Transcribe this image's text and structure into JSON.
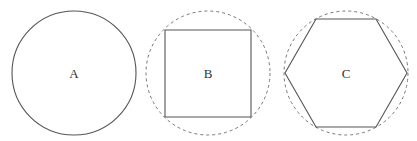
{
  "figures": [
    {
      "id": "A",
      "label": "A",
      "shape": "circle",
      "outline": "solid",
      "circle": {
        "cx": 74,
        "cy": 73,
        "r": 62
      }
    },
    {
      "id": "B",
      "label": "B",
      "shape": "square inscribed in circle",
      "outline": "solid square, dashed circumscribed circle",
      "circle": {
        "cx": 208,
        "cy": 73,
        "r": 62
      },
      "polygon": "165,30 251,30 251,117 165,117"
    },
    {
      "id": "C",
      "label": "C",
      "shape": "hexagon inscribed in circle",
      "outline": "solid hexagon, dashed circumscribed circle",
      "circle": {
        "cx": 346,
        "cy": 73,
        "r": 62
      },
      "polygon": "316,19 376,19 407,73 376,127 316,127 285,73"
    }
  ],
  "colors": {
    "stroke": "#555555",
    "dashed_stroke": "#777777",
    "label": "#333333",
    "background": "#ffffff"
  }
}
